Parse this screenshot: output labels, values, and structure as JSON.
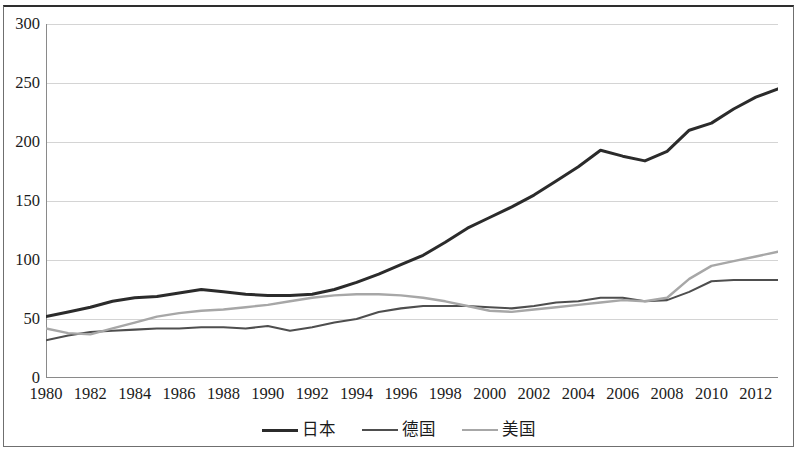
{
  "chart_data": {
    "type": "line",
    "title": "",
    "subtitle": "",
    "xlabel": "",
    "ylabel": "",
    "xlim": [
      1980,
      2013
    ],
    "ylim": [
      0,
      300
    ],
    "y_ticks": [
      0,
      50,
      100,
      150,
      200,
      250,
      300
    ],
    "y_tick_labels": [
      "0",
      "50",
      "100",
      "150",
      "200",
      "250",
      "300"
    ],
    "x_ticks": [
      1980,
      1982,
      1984,
      1986,
      1988,
      1990,
      1992,
      1994,
      1996,
      1998,
      2000,
      2002,
      2004,
      2006,
      2008,
      2010,
      2012
    ],
    "x_tick_labels": [
      "1980",
      "1982",
      "1984",
      "1986",
      "1988",
      "1990",
      "1992",
      "1994",
      "1996",
      "1998",
      "2000",
      "2002",
      "2004",
      "2006",
      "2008",
      "2010",
      "2012"
    ],
    "x_minor_step": 1,
    "grid": "horizontal",
    "legend_position": "bottom-center",
    "x": [
      1980,
      1981,
      1982,
      1983,
      1984,
      1985,
      1986,
      1987,
      1988,
      1989,
      1990,
      1991,
      1992,
      1993,
      1994,
      1995,
      1996,
      1997,
      1998,
      1999,
      2000,
      2001,
      2002,
      2003,
      2004,
      2005,
      2006,
      2007,
      2008,
      2009,
      2010,
      2011,
      2012,
      2013
    ],
    "series": [
      {
        "name": "日本",
        "color": "#2b2b2b",
        "width": 3.0,
        "values": [
          52,
          56,
          60,
          65,
          68,
          69,
          72,
          75,
          73,
          71,
          70,
          70,
          71,
          75,
          81,
          88,
          96,
          104,
          115,
          127,
          136,
          145,
          155,
          167,
          179,
          193,
          188,
          184,
          192,
          210,
          216,
          228,
          238,
          245
        ]
      },
      {
        "name": "德国",
        "color": "#4e4e4e",
        "width": 2.1,
        "values": [
          32,
          36,
          39,
          40,
          41,
          42,
          42,
          43,
          43,
          42,
          44,
          40,
          43,
          47,
          50,
          56,
          59,
          61,
          61,
          61,
          60,
          59,
          61,
          64,
          65,
          68,
          68,
          65,
          66,
          73,
          82,
          83,
          83,
          83
        ]
      },
      {
        "name": "美国",
        "color": "#a7a7a7",
        "width": 2.4,
        "values": [
          42,
          38,
          37,
          42,
          47,
          52,
          55,
          57,
          58,
          60,
          62,
          65,
          68,
          70,
          71,
          71,
          70,
          68,
          65,
          61,
          57,
          56,
          58,
          60,
          62,
          64,
          66,
          65,
          68,
          84,
          95,
          99,
          103,
          107
        ]
      }
    ]
  },
  "axes": {
    "y_labels": [
      "300",
      "250",
      "200",
      "150",
      "100",
      "50",
      "0"
    ],
    "x_labels": [
      "1980",
      "1982",
      "1984",
      "1986",
      "1988",
      "1990",
      "1992",
      "1994",
      "1996",
      "1998",
      "2000",
      "2002",
      "2004",
      "2006",
      "2008",
      "2010",
      "2012"
    ]
  },
  "legend": {
    "items": [
      {
        "label": "日本",
        "color": "#2b2b2b",
        "width": 3.4
      },
      {
        "label": "德国",
        "color": "#4e4e4e",
        "width": 2.6
      },
      {
        "label": "美国",
        "color": "#a7a7a7",
        "width": 2.6
      }
    ]
  },
  "colors": {
    "grid": "#d4d4d4",
    "axis": "#8a8a8a",
    "frame": "#6f6f6f",
    "frame_top": "#2e2e2e",
    "text": "#1b1b1b",
    "background": "#ffffff"
  }
}
